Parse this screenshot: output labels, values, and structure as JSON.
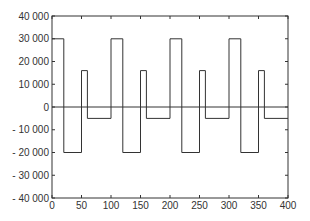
{
  "chart_data": {
    "type": "line",
    "title": "",
    "xlabel": "",
    "ylabel": "",
    "xlim": [
      0,
      400
    ],
    "ylim": [
      -40000,
      40000
    ],
    "grid": false,
    "legend": null,
    "x_ticks": [
      0,
      50,
      100,
      150,
      200,
      250,
      300,
      350,
      400
    ],
    "x_tick_labels": [
      "0",
      "50",
      "100",
      "150",
      "200",
      "250",
      "300",
      "350",
      "400"
    ],
    "y_ticks": [
      40000,
      30000,
      20000,
      10000,
      0,
      -10000,
      -20000,
      -30000,
      -40000
    ],
    "y_tick_labels": [
      "40 000",
      "30 000",
      "20 000",
      "10 000",
      "0",
      "- 10 000",
      "- 20 000",
      "- 30 000",
      "- 40 000"
    ],
    "zero_line": true,
    "series": [
      {
        "name": "step signal",
        "step": true,
        "x": [
          0,
          20,
          20,
          50,
          50,
          60,
          60,
          100,
          100,
          120,
          120,
          150,
          150,
          160,
          160,
          200,
          200,
          220,
          220,
          250,
          250,
          260,
          260,
          300,
          300,
          320,
          320,
          350,
          350,
          360,
          360,
          400
        ],
        "y": [
          30000,
          30000,
          -20000,
          -20000,
          16000,
          16000,
          -5000,
          -5000,
          30000,
          30000,
          -20000,
          -20000,
          16000,
          16000,
          -5000,
          -5000,
          30000,
          30000,
          -20000,
          -20000,
          16000,
          16000,
          -5000,
          -5000,
          30000,
          30000,
          -20000,
          -20000,
          16000,
          16000,
          -5000,
          -5000
        ]
      }
    ],
    "colors": {
      "line": "#333333",
      "axis": "#333333",
      "background": "#ffffff"
    }
  }
}
